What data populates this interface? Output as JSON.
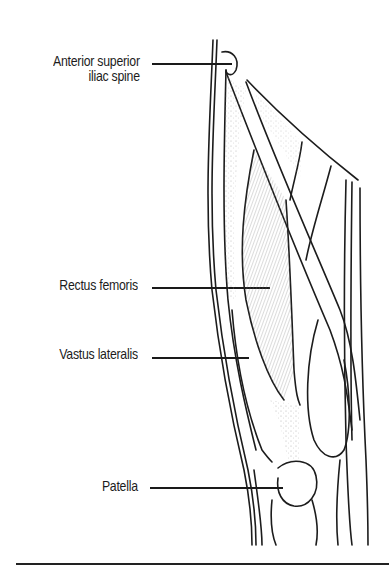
{
  "figure": {
    "labels": [
      {
        "id": "asis",
        "line1": "Anterior superior",
        "line2": "iliac spine"
      },
      {
        "id": "rectus",
        "line1": "Rectus femoris"
      },
      {
        "id": "vastus",
        "line1": "Vastus lateralis"
      },
      {
        "id": "patella",
        "line1": "Patella"
      }
    ]
  },
  "colors": {
    "ink": "#1c1c1c",
    "background": "#ffffff",
    "shading": "#9a9a9a"
  }
}
